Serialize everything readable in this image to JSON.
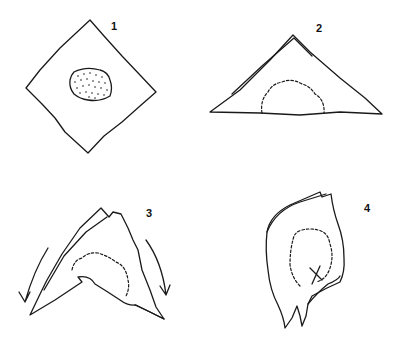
{
  "figure": {
    "steps": [
      {
        "label": "1",
        "caption": "square wrapper laid as diamond with filling in center"
      },
      {
        "label": "2",
        "caption": "folded in half into a triangle over the filling"
      },
      {
        "label": "3",
        "caption": "side corners folded down"
      },
      {
        "label": "4",
        "caption": "rolled into cone-shaped packet"
      }
    ]
  },
  "colors": {
    "ink": "#1a1a1a",
    "background": "#ffffff"
  }
}
